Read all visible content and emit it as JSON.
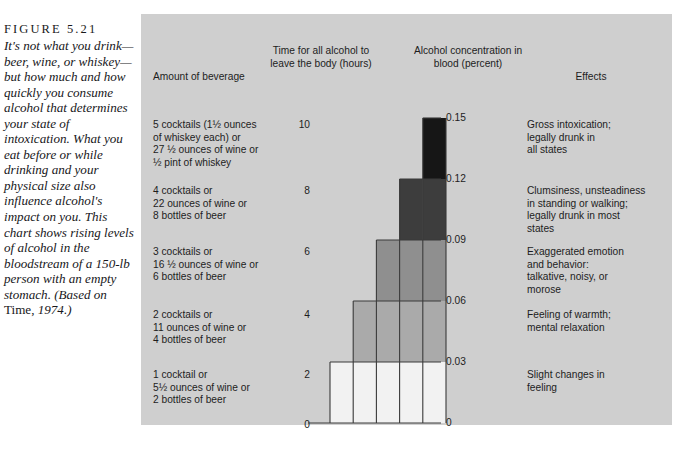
{
  "caption": {
    "figure_number": "FIGURE 5.21",
    "text_parts": [
      {
        "style": "italic",
        "text": "It's not what you drink—beer, wine, or whiskey—but how much and how quickly you consume alcohol that determines your state of intoxication. What you eat before or while drinking and your physical size also influence alcohol's impact on you. This chart shows rising levels of alcohol in the bloodstream of a 150-lb person with an empty stomach. (Based on "
      },
      {
        "style": "roman",
        "text": "Time,"
      },
      {
        "style": "italic",
        "text": " 1974.)"
      }
    ]
  },
  "headers": {
    "beverage": "Amount of beverage",
    "time": "Time for all\nalcohol to leave\nthe body (hours)",
    "concentration": "Alcohol\nconcentration in\nblood (percent)",
    "effects": "Effects"
  },
  "rows": [
    {
      "beverage": "5 cocktails (1½ ounces\nof whiskey each) or\n27 ½ ounces of wine or\n½ pint of whiskey",
      "hours": "10",
      "concentration": "0.15",
      "effects": "Gross intoxication;\nlegally drunk in\nall states"
    },
    {
      "beverage": "4 cocktails or\n22 ounces of wine or\n8 bottles of beer",
      "hours": "8",
      "concentration": "0.12",
      "effects": "Clumsiness, unsteadiness\nin standing or walking;\nlegally drunk in most\nstates"
    },
    {
      "beverage": "3 cocktails or\n16 ½ ounces of wine or\n6 bottles of beer",
      "hours": "6",
      "concentration": "0.09",
      "effects": "Exaggerated emotion\nand behavior:\ntalkative, noisy, or\nmorose"
    },
    {
      "beverage": "2 cocktails or\n11 ounces of wine or\n4 bottles of beer",
      "hours": "4",
      "concentration": "0.06",
      "effects": "Feeling of warmth;\nmental relaxation"
    },
    {
      "beverage": "1 cocktail or\n5½ ounces of wine or\n2 bottles of beer",
      "hours": "2",
      "concentration": "0.03",
      "effects": "Slight changes in\nfeeling"
    }
  ],
  "axis_zero": {
    "hours": "0",
    "concentration": "0"
  },
  "chart_data": {
    "type": "bar",
    "title": "Alcohol concentration in blood (percent)",
    "xlabel": "Amount of beverage",
    "ylabel": "Alcohol concentration in blood (percent)",
    "categories": [
      "1 cocktail or 5½ ounces of wine or 2 bottles of beer",
      "2 cocktails or 11 ounces of wine or 4 bottles of beer",
      "3 cocktails or 16 ½ ounces of wine or 6 bottles of beer",
      "4 cocktails or 22 ounces of wine or 8 bottles of beer",
      "5 cocktails (1½ ounces of whiskey each) or 27 ½ ounces of wine or ½ pint of whiskey"
    ],
    "values": [
      0.03,
      0.06,
      0.09,
      0.12,
      0.15
    ],
    "hours_to_clear": [
      2,
      4,
      6,
      8,
      10
    ],
    "ytick_labels": [
      "0",
      "0.03",
      "0.06",
      "0.09",
      "0.12",
      "0.15"
    ],
    "ytick_values": [
      0,
      0.03,
      0.06,
      0.09,
      0.12,
      0.15
    ],
    "hours_tick_labels": [
      "0",
      "2",
      "4",
      "6",
      "8",
      "10"
    ],
    "ylim": [
      0,
      0.15
    ],
    "grid": false,
    "legend": "none",
    "band_colors": [
      "#f2f2f2",
      "#aaaaaa",
      "#8f8f8f",
      "#3d3d3d",
      "#161616"
    ],
    "panel_color": "#cfcfcf",
    "line_color": "#3a3a3a"
  }
}
